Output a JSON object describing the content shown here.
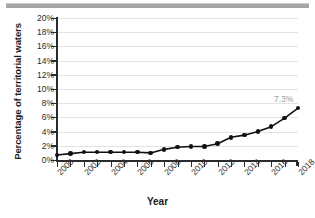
{
  "figure": {
    "background_color": "#ffffff",
    "top_divider_color": "#a6a6a6"
  },
  "chart_data": {
    "type": "line",
    "title": "",
    "xlabel": "Year",
    "ylabel": "Percentage of territorial waters",
    "x": [
      2000,
      2001,
      2002,
      2003,
      2004,
      2005,
      2006,
      2007,
      2008,
      2009,
      2010,
      2011,
      2012,
      2013,
      2014,
      2015,
      2016,
      2017,
      2018
    ],
    "values": [
      0.7,
      0.9,
      1.1,
      1.1,
      1.1,
      1.1,
      1.1,
      1.0,
      1.5,
      1.8,
      1.9,
      1.9,
      2.3,
      3.2,
      3.5,
      4.0,
      4.7,
      5.9,
      7.3
    ],
    "categories": [
      "2000",
      "2001",
      "2002",
      "2003",
      "2004",
      "2005",
      "2006",
      "2007",
      "2008",
      "2009",
      "2010",
      "2011",
      "2012",
      "2013",
      "2014",
      "2015",
      "2016",
      "2017",
      "2018"
    ],
    "xtick_labels": [
      "2000",
      "2002",
      "2004",
      "2006",
      "2008",
      "2010",
      "2012",
      "2014",
      "2016",
      "2018"
    ],
    "xtick_values": [
      2000,
      2002,
      2004,
      2006,
      2008,
      2010,
      2012,
      2014,
      2016,
      2018
    ],
    "ytick_labels": [
      "0%",
      "2%",
      "4%",
      "6%",
      "8%",
      "10%",
      "12%",
      "14%",
      "16%",
      "18%",
      "20%"
    ],
    "ytick_values": [
      0,
      2,
      4,
      6,
      8,
      10,
      12,
      14,
      16,
      18,
      20
    ],
    "xlim": [
      2000,
      2018
    ],
    "ylim": [
      0,
      20
    ],
    "grid": true,
    "grid_axis": "y",
    "legend": false,
    "legend_position": "none",
    "line_color": "#111111",
    "marker_color": "#111111",
    "grid_color": "#e3e3e3",
    "annotations": [
      {
        "text": "7.3%",
        "x": 2018,
        "y": 7.3,
        "color": "#9b9b9b"
      }
    ]
  }
}
